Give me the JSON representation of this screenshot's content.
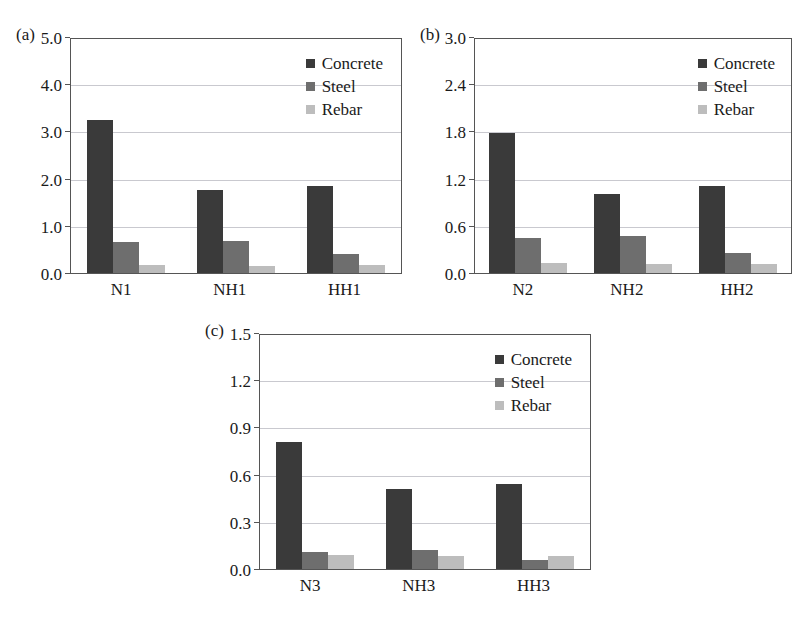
{
  "chart_data": [
    {
      "type": "bar",
      "panel_tag": "(a)",
      "title": "",
      "xlabel": "",
      "ylabel": "",
      "categories": [
        "N1",
        "NH1",
        "HH1"
      ],
      "ylim": [
        0.0,
        5.0
      ],
      "yticks": [
        "5.0",
        "4.0",
        "3.0",
        "2.0",
        "1.0",
        "0.0"
      ],
      "ytick_values": [
        5.0,
        4.0,
        3.0,
        2.0,
        1.0,
        0.0
      ],
      "grid": true,
      "legend_position": "top-right",
      "series": [
        {
          "name": "Concrete",
          "color": "#3a3a3a",
          "values": [
            3.24,
            1.75,
            1.85
          ]
        },
        {
          "name": "Steel",
          "color": "#6e6e6e",
          "values": [
            0.65,
            0.68,
            0.4
          ]
        },
        {
          "name": "Rebar",
          "color": "#bdbdbd",
          "values": [
            0.17,
            0.15,
            0.18
          ]
        }
      ]
    },
    {
      "type": "bar",
      "panel_tag": "(b)",
      "title": "",
      "xlabel": "",
      "ylabel": "",
      "categories": [
        "N2",
        "NH2",
        "HH2"
      ],
      "ylim": [
        0.0,
        3.0
      ],
      "yticks": [
        "3.0",
        "2.4",
        "1.8",
        "1.2",
        "0.6",
        "0.0"
      ],
      "ytick_values": [
        3.0,
        2.4,
        1.8,
        1.2,
        0.6,
        0.0
      ],
      "grid": true,
      "legend_position": "top-right",
      "series": [
        {
          "name": "Concrete",
          "color": "#3a3a3a",
          "values": [
            1.78,
            1.0,
            1.1
          ]
        },
        {
          "name": "Steel",
          "color": "#6e6e6e",
          "values": [
            0.45,
            0.47,
            0.25
          ]
        },
        {
          "name": "Rebar",
          "color": "#bdbdbd",
          "values": [
            0.13,
            0.12,
            0.12
          ]
        }
      ]
    },
    {
      "type": "bar",
      "panel_tag": "(c)",
      "title": "",
      "xlabel": "",
      "ylabel": "",
      "categories": [
        "N3",
        "NH3",
        "HH3"
      ],
      "ylim": [
        0.0,
        1.5
      ],
      "yticks": [
        "1.5",
        "1.2",
        "0.9",
        "0.6",
        "0.3",
        "0.0"
      ],
      "ytick_values": [
        1.5,
        1.2,
        0.9,
        0.6,
        0.3,
        0.0
      ],
      "grid": true,
      "legend_position": "top-right",
      "series": [
        {
          "name": "Concrete",
          "color": "#3a3a3a",
          "values": [
            0.81,
            0.51,
            0.54
          ]
        },
        {
          "name": "Steel",
          "color": "#6e6e6e",
          "values": [
            0.11,
            0.12,
            0.06
          ]
        },
        {
          "name": "Rebar",
          "color": "#bdbdbd",
          "values": [
            0.09,
            0.08,
            0.08
          ]
        }
      ]
    }
  ]
}
